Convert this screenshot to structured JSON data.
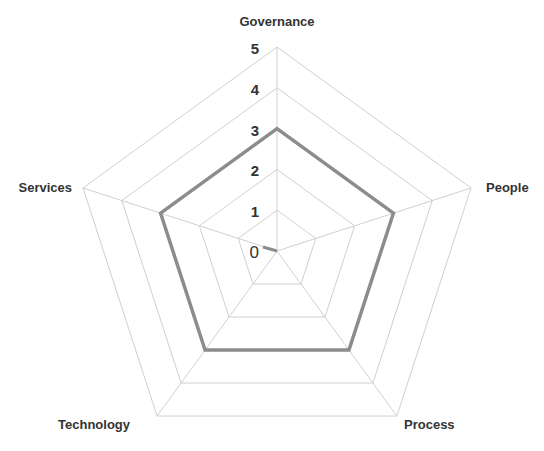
{
  "chart_data": {
    "type": "radar",
    "title": "",
    "categories": [
      "Governance",
      "People",
      "Process",
      "Technology",
      "Services"
    ],
    "series": [
      {
        "name": "Score",
        "values": [
          3,
          3,
          3,
          3,
          3
        ],
        "color": "#8c8c8c"
      }
    ],
    "rlim": [
      0,
      5
    ],
    "ticks": [
      "0",
      "1",
      "2",
      "3",
      "4",
      "5"
    ],
    "grid": true,
    "grid_color": "#d0d0d0",
    "legend": "none"
  }
}
